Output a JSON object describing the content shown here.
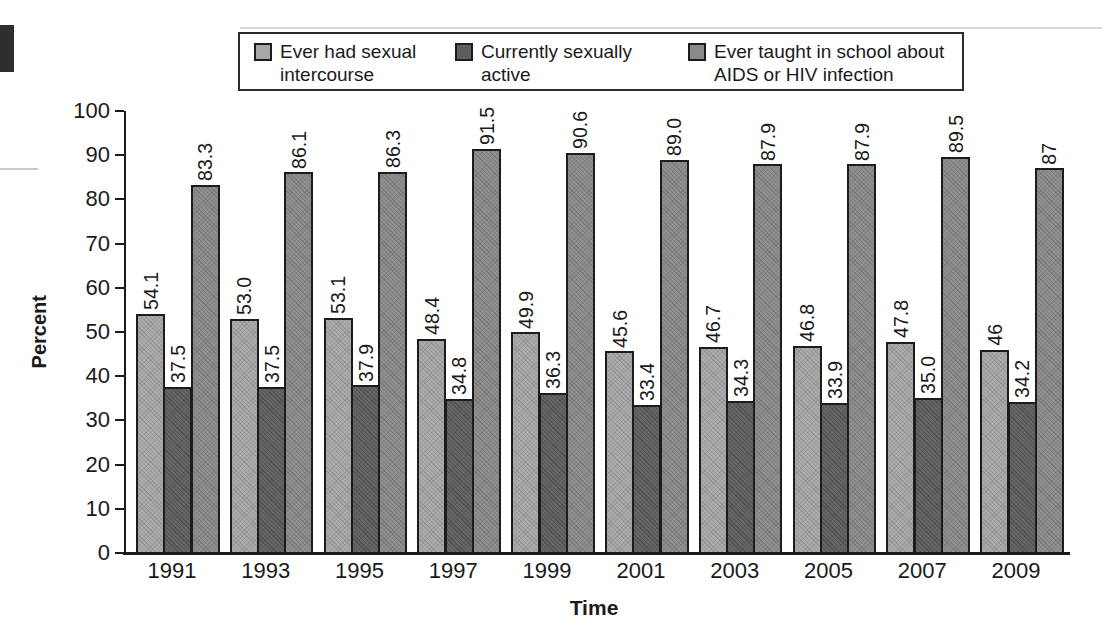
{
  "chart_data": {
    "type": "bar",
    "title": "",
    "xlabel": "Time",
    "ylabel": "Percent",
    "ylim": [
      0,
      100
    ],
    "yticks": [
      0,
      10,
      20,
      30,
      40,
      50,
      60,
      70,
      80,
      90,
      100
    ],
    "categories": [
      "1991",
      "1993",
      "1995",
      "1997",
      "1999",
      "2001",
      "2003",
      "2005",
      "2007",
      "2009"
    ],
    "series": [
      {
        "name": "Ever had sexual intercourse",
        "legend_lines": [
          "Ever had sexual",
          "intercourse"
        ],
        "color": "#a8a8a8",
        "values": [
          54.1,
          53.0,
          53.1,
          48.4,
          49.9,
          45.6,
          46.7,
          46.8,
          47.8,
          46
        ],
        "labels": [
          "54.1",
          "53.0",
          "53.1",
          "48.4",
          "49.9",
          "45.6",
          "46.7",
          "46.8",
          "47.8",
          "46"
        ]
      },
      {
        "name": "Currently sexually active",
        "legend_lines": [
          "Currently sexually",
          "active"
        ],
        "color": "#5d5d5d",
        "values": [
          37.5,
          37.5,
          37.9,
          34.8,
          36.3,
          33.4,
          34.3,
          33.9,
          35.0,
          34.2
        ],
        "labels": [
          "37.5",
          "37.5",
          "37.9",
          "34.8",
          "36.3",
          "33.4",
          "34.3",
          "33.9",
          "35.0",
          "34.2"
        ]
      },
      {
        "name": "Ever taught in school about AIDS or HIV infection",
        "legend_lines": [
          "Ever taught in school about",
          "AIDS or HIV infection"
        ],
        "color": "#8a8a8a",
        "values": [
          83.3,
          86.1,
          86.3,
          91.5,
          90.6,
          89.0,
          87.9,
          87.9,
          89.5,
          87
        ],
        "labels": [
          "83.3",
          "86.1",
          "86.3",
          "91.5",
          "90.6",
          "89.0",
          "87.9",
          "87.9",
          "89.5",
          "87"
        ]
      }
    ],
    "legend_position": "top",
    "grid": false,
    "bar_border_color": "#1c1c1c",
    "axis_color": "#1c1c1c",
    "text_color": "#1a1a1a",
    "background": "#ffffff"
  }
}
